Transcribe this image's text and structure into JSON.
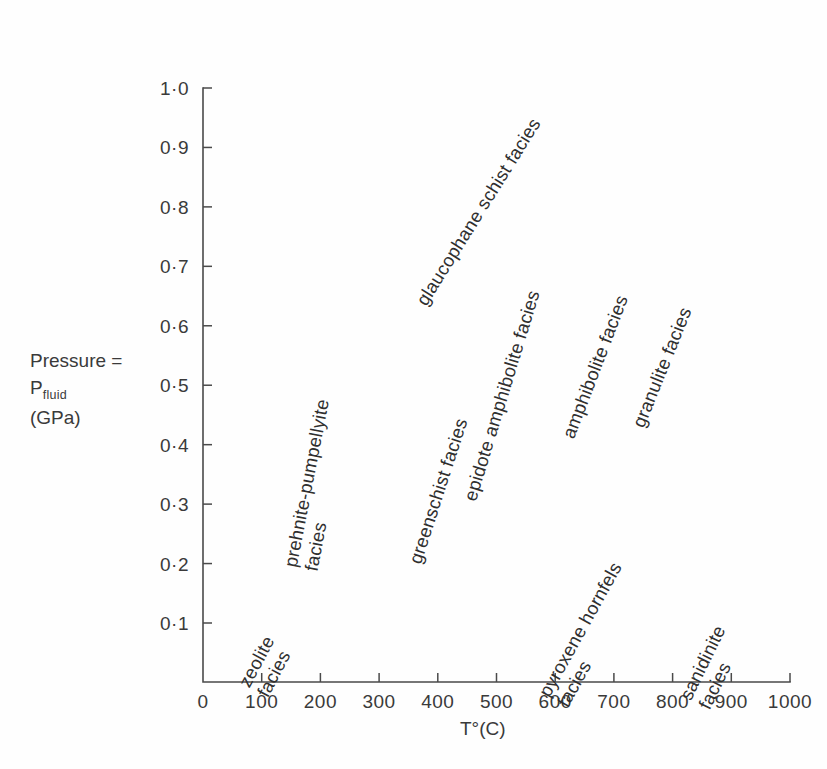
{
  "chart_data": {
    "type": "scatter",
    "title": "",
    "xlabel": "T°(C)",
    "ylabel_lines": [
      "Pressure =",
      "P",
      "fluid",
      "(GPa)"
    ],
    "xlim": [
      0,
      1000
    ],
    "ylim": [
      0,
      1.0
    ],
    "grid": false,
    "legend": "none",
    "xticks": [
      "0",
      "100",
      "200",
      "300",
      "400",
      "500",
      "600",
      "700",
      "800",
      "900",
      "1000"
    ],
    "xtick_values": [
      0,
      100,
      200,
      300,
      400,
      500,
      600,
      700,
      800,
      900,
      1000
    ],
    "yticks": [
      "0·1",
      "0·2",
      "0·3",
      "0·4",
      "0·5",
      "0·6",
      "0·7",
      "0·8",
      "0·9",
      "1·0"
    ],
    "ytick_values": [
      0.1,
      0.2,
      0.3,
      0.4,
      0.5,
      0.6,
      0.7,
      0.8,
      0.9,
      1.0
    ],
    "annotations": [
      {
        "name": "zeolite",
        "lines": [
          "zeolite",
          "facies"
        ],
        "x_c": 175,
        "y_gpa": 0.02,
        "rotation_deg": -62,
        "left_px": 272,
        "top_px": 658
      },
      {
        "name": "prehnite-pumpellyite",
        "lines": [
          "prehnite-pumpellyite",
          "facies"
        ],
        "x_c": 205,
        "y_gpa": 0.26,
        "rotation_deg": -79,
        "left_px": 322,
        "top_px": 530
      },
      {
        "name": "greenschist",
        "lines": [
          "greenschist facies"
        ],
        "x_c": 385,
        "y_gpa": 0.21,
        "rotation_deg": -72,
        "left_px": 425,
        "top_px": 545
      },
      {
        "name": "glaucophane-schist",
        "lines": [
          "glaucophane schist facies"
        ],
        "x_c": 325,
        "y_gpa": 0.58,
        "rotation_deg": -58,
        "left_px": 430,
        "top_px": 288
      },
      {
        "name": "epidote-amphibolite",
        "lines": [
          "epidote amphibolite facies"
        ],
        "x_c": 510,
        "y_gpa": 0.33,
        "rotation_deg": -73,
        "left_px": 480,
        "top_px": 482
      },
      {
        "name": "amphibolite",
        "lines": [
          "amphibolite facies"
        ],
        "x_c": 640,
        "y_gpa": 0.4,
        "rotation_deg": -69,
        "left_px": 578,
        "top_px": 420
      },
      {
        "name": "granulite",
        "lines": [
          "granulite facies"
        ],
        "x_c": 765,
        "y_gpa": 0.43,
        "rotation_deg": -68,
        "left_px": 648,
        "top_px": 409
      },
      {
        "name": "pyroxene-hornfels",
        "lines": [
          "pyroxene hornfels",
          "facies"
        ],
        "x_c": 660,
        "y_gpa": 0.04,
        "rotation_deg": -61,
        "left_px": 572,
        "top_px": 668
      },
      {
        "name": "sanidinite",
        "lines": [
          "sanidinite",
          "facies"
        ],
        "x_c": 880,
        "y_gpa": 0.02,
        "rotation_deg": -64,
        "left_px": 714,
        "top_px": 670
      }
    ]
  },
  "colors": {
    "ink": "#3a3a3a",
    "axis": "#4a4a4a",
    "background": "#fefefe"
  }
}
